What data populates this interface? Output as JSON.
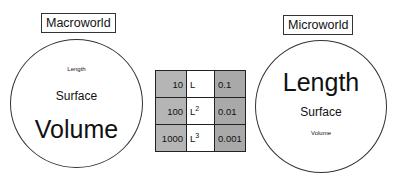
{
  "macroworld": {
    "title": "Macroworld",
    "words": [
      {
        "text": "Length",
        "size": "small"
      },
      {
        "text": "Surface",
        "size": "medium"
      },
      {
        "text": "Volume",
        "size": "large"
      }
    ]
  },
  "microworld": {
    "title": "Microworld",
    "words": [
      {
        "text": "Length",
        "size": "large"
      },
      {
        "text": "Surface",
        "size": "medium"
      },
      {
        "text": "Volume",
        "size": "small"
      }
    ]
  },
  "scale_table": {
    "rows": [
      {
        "value": "10",
        "base": "L",
        "exponent": "",
        "inverse": "0.1"
      },
      {
        "value": "100",
        "base": "L",
        "exponent": "2",
        "inverse": "0.01"
      },
      {
        "value": "1000",
        "base": "L",
        "exponent": "3",
        "inverse": "0.001"
      }
    ]
  },
  "colors": {
    "cell_left": "#b5b5b5",
    "cell_middle": "#ffffff",
    "cell_right": "#a9a9a9",
    "stroke": "#333333"
  }
}
